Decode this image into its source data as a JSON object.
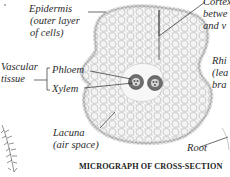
{
  "caption": "MICROGRAPH OF CROSS-SECTION",
  "labels": {
    "epidermis_line1": "Epidermis",
    "epidermis_line2": "(outer layer",
    "epidermis_line3": "of cells)",
    "cortex_line1": "Cortex",
    "cortex_line2": "betwe",
    "cortex_line3": "and v",
    "vascular_line1": "Vascular",
    "vascular_line2": "tissue",
    "phloem": "Phloem",
    "xylem": "Xylem",
    "rhizome_line1": "Rhi",
    "rhizome_line2": "(lea",
    "rhizome_line3": "bra",
    "lacuna_line1": "Lacuna",
    "lacuna_line2": "(air space)",
    "root": "Root"
  },
  "colors": {
    "ink": "#2b2b2b",
    "cell_fill": "#f4f4f4",
    "vascular_dark": "#6a6a6a",
    "background": "#ffffff"
  }
}
